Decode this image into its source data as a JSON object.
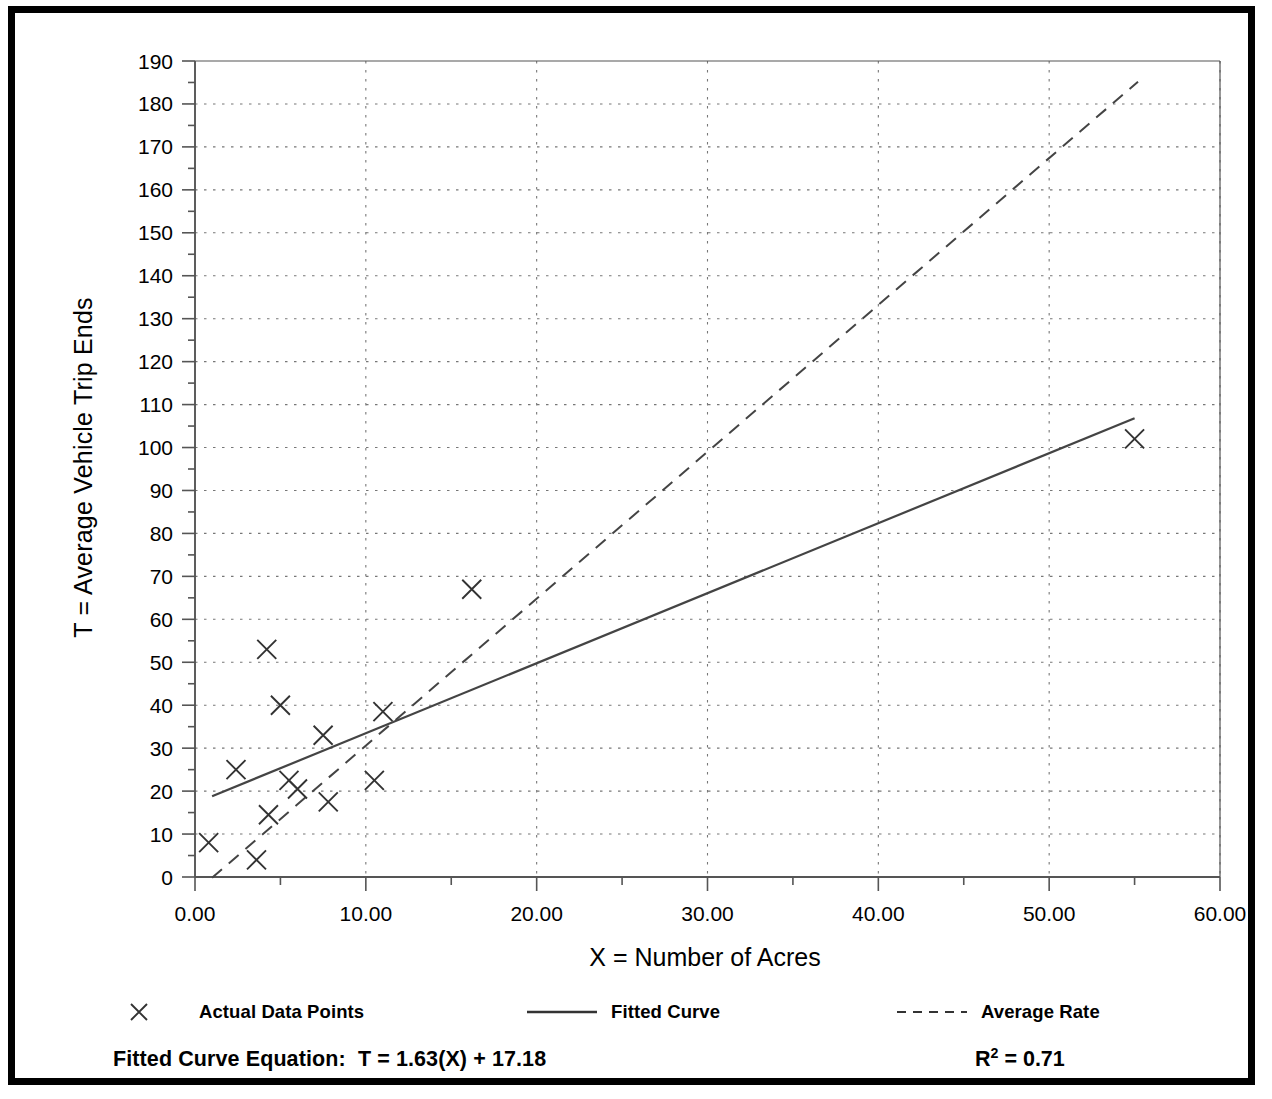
{
  "chart_data": {
    "type": "scatter",
    "title": "",
    "xlabel": "X = Number of Acres",
    "ylabel": "T = Average Vehicle Trip Ends",
    "xlim": [
      0,
      60
    ],
    "ylim": [
      0,
      190
    ],
    "xticks": [
      0,
      10,
      20,
      30,
      40,
      50,
      60
    ],
    "xtick_labels": [
      "0.00",
      "10.00",
      "20.00",
      "30.00",
      "40.00",
      "50.00",
      "60.00"
    ],
    "yticks": [
      0,
      10,
      20,
      30,
      40,
      50,
      60,
      70,
      80,
      90,
      100,
      110,
      120,
      130,
      140,
      150,
      160,
      170,
      180,
      190
    ],
    "ytick_labels": [
      "0",
      "10",
      "20",
      "30",
      "40",
      "50",
      "60",
      "70",
      "80",
      "90",
      "100",
      "110",
      "120",
      "130",
      "140",
      "150",
      "160",
      "170",
      "180",
      "190"
    ],
    "x_minor_tick_step": 5,
    "y_minor_tick_step": 5,
    "grid": true,
    "grid_style": "dotted",
    "legend_position": "below-axes",
    "points": [
      {
        "x": 0.8,
        "y": 8.0
      },
      {
        "x": 2.4,
        "y": 25.0
      },
      {
        "x": 3.6,
        "y": 4.0
      },
      {
        "x": 4.2,
        "y": 53.0
      },
      {
        "x": 4.3,
        "y": 14.5
      },
      {
        "x": 5.0,
        "y": 40.0
      },
      {
        "x": 5.5,
        "y": 22.5
      },
      {
        "x": 6.0,
        "y": 20.5
      },
      {
        "x": 7.5,
        "y": 33.0
      },
      {
        "x": 7.8,
        "y": 17.5
      },
      {
        "x": 10.5,
        "y": 22.5
      },
      {
        "x": 11.0,
        "y": 38.5
      },
      {
        "x": 16.2,
        "y": 67.0
      },
      {
        "x": 55.0,
        "y": 102.0
      }
    ],
    "series": [
      {
        "name": "Fitted Curve",
        "style": "solid",
        "slope": 1.63,
        "intercept": 17.18,
        "x_start": 1.0,
        "x_end": 55.0
      },
      {
        "name": "Average Rate",
        "style": "dashed",
        "slope": 3.42,
        "intercept": -3.6,
        "x_start": 1.0,
        "x_end": 55.2
      }
    ]
  },
  "legend": {
    "items": [
      {
        "key": "x-marker-icon",
        "label": "Actual Data Points"
      },
      {
        "key": "solid-line-icon",
        "label": "Fitted Curve"
      },
      {
        "key": "dashed-line-icon",
        "label": "Average Rate"
      }
    ]
  },
  "footer": {
    "equation_label": "Fitted Curve Equation:",
    "equation_value": "T = 1.63(X) + 17.18",
    "r_squared_symbol": "R",
    "r_squared_exponent": "2",
    "r_squared_value": "= 0.71"
  },
  "colors": {
    "frame": "#000000",
    "background": "#ffffff",
    "axis": "#555555",
    "grid": "#777777",
    "marker": "#333333",
    "fitted_line": "#444444",
    "average_line": "#444444"
  }
}
